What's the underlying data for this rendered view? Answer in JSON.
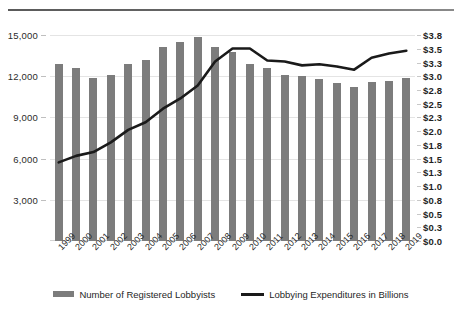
{
  "chart_data": {
    "type": "bar",
    "title": "",
    "xlabel": "",
    "ylabel": "",
    "grid": true,
    "legend_position": "bottom-center",
    "categories": [
      "1999",
      "2000",
      "2001",
      "2002",
      "2003",
      "2004",
      "2005",
      "2006",
      "2007",
      "2008",
      "2009",
      "2010",
      "2011",
      "2012",
      "2013",
      "2014",
      "2015",
      "2016",
      "2017",
      "2018",
      "2019"
    ],
    "left_axis": {
      "label": "",
      "ylim": [
        0,
        15000
      ],
      "ticks": [
        3000,
        6000,
        9000,
        12000,
        15000
      ],
      "tick_labels": [
        "3,000",
        "6,000",
        "9,000",
        "12,000",
        "15,000"
      ]
    },
    "right_axis": {
      "label": "",
      "ylim": [
        0,
        3.8
      ],
      "ticks": [
        0.0,
        0.25,
        0.5,
        0.76,
        1.01,
        1.27,
        1.52,
        1.77,
        2.03,
        2.28,
        2.53,
        2.79,
        3.04,
        3.29,
        3.55,
        3.8
      ],
      "tick_labels": [
        "$0.0",
        "$0.3",
        "$0.5",
        "$0.8",
        "$1.0",
        "$1.3",
        "$1.5",
        "$1.8",
        "$2.0",
        "$2.3",
        "$2.5",
        "$2.8",
        "$3.0",
        "$3.3",
        "$3.5",
        "$3.8"
      ]
    },
    "series": [
      {
        "name": "Number of Registered Lobbyists",
        "type": "bar",
        "axis": "left",
        "color": "#7c7c7c",
        "values": [
          12900,
          12600,
          11850,
          12100,
          12900,
          13150,
          14100,
          14500,
          14850,
          14100,
          13750,
          12900,
          12600,
          12100,
          12050,
          11800,
          11500,
          11200,
          11550,
          11650,
          11900
        ]
      },
      {
        "name": "Lobbying Expenditures in Billions",
        "type": "line",
        "axis": "right",
        "color": "#1a1a1a",
        "values": [
          1.45,
          1.57,
          1.64,
          1.82,
          2.05,
          2.19,
          2.44,
          2.63,
          2.87,
          3.31,
          3.55,
          3.55,
          3.33,
          3.31,
          3.24,
          3.26,
          3.22,
          3.16,
          3.38,
          3.46,
          3.51
        ]
      }
    ]
  },
  "legend": {
    "items": [
      {
        "label": "Number of Registered Lobbyists",
        "marker": "bar-swatch"
      },
      {
        "label": "Lobbying Expenditures in Billions",
        "marker": "line-swatch"
      }
    ]
  }
}
